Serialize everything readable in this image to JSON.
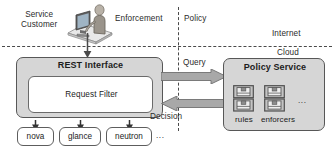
{
  "diagram": {
    "zones": {
      "service_customer": "Service\nCustomer",
      "enforcement": "Enforcement",
      "policy": "Policy",
      "internet": "Internet",
      "cloud": "Cloud"
    },
    "enforcement_side": {
      "rest_interface_label": "REST Interface",
      "request_filter_label": "Request Filter",
      "services": [
        {
          "label": "nova"
        },
        {
          "label": "glance"
        },
        {
          "label": "neutron"
        }
      ],
      "services_ellipsis": "..."
    },
    "policy_side": {
      "policy_service_label": "Policy Service",
      "stores": [
        {
          "label": "rules",
          "icon": "database-stack-icon"
        },
        {
          "label": "enforcers",
          "icon": "database-stack-icon"
        }
      ],
      "stores_ellipsis": "..."
    },
    "flows": [
      {
        "label": "Query",
        "direction": "right"
      },
      {
        "label": "Decision",
        "direction": "left"
      }
    ],
    "icons": {
      "customer": "person-at-computer-icon"
    },
    "colors": {
      "box_fill": "#d6d6d6",
      "inner_fill": "#ffffff",
      "stroke": "#575757",
      "arrow_fill": "#a8a8a8",
      "arrow_stroke": "#6f6f6f",
      "text": "#1c1c1c",
      "dash": "#4a4a4a"
    }
  }
}
